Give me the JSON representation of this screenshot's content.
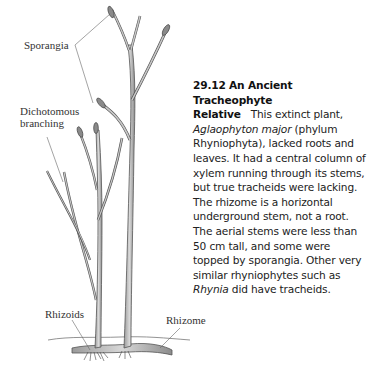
{
  "figure": {
    "number": "29.12",
    "title_line1": "An Ancient Tracheophyte",
    "title_line2": "Relative",
    "caption": {
      "p1": "This extinct plant,",
      "species_italic": "Aglaophyton major",
      "p2": " (phylum Rhyniophyta), lacked roots and leaves. It had a central column of xylem running through its stems, but true tracheids were lacking. The rhizome is a horizontal underground stem, not a root. The aerial stems were less than 50 cm tall, and some were topped by sporangia. Other very similar rhyniophytes such as ",
      "genus_italic": "Rhynia",
      "p3": " did have tracheids."
    }
  },
  "labels": {
    "sporangia": "Sporangia",
    "dichotomous_line1": "Dichotomous",
    "dichotomous_line2": "branching",
    "rhizoids": "Rhizoids",
    "rhizome": "Rhizome"
  },
  "colors": {
    "stem_fill": "#bdbdbd",
    "stem_outline": "#555555",
    "sporangium_fill": "#8a8a8a",
    "leader_line": "#666666",
    "text": "#222222"
  }
}
